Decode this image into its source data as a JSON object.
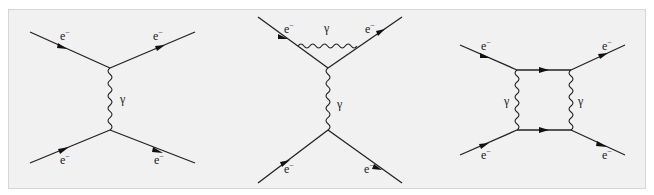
{
  "figure": {
    "background_color": "#f1f1f1",
    "line_color": "#222222",
    "diagrams": [
      {
        "name": "tree-level-electron-scattering",
        "labels": {
          "in_top": "e",
          "in_bottom": "e",
          "out_top": "e",
          "out_bottom": "e",
          "charge": "−",
          "photon": "γ"
        }
      },
      {
        "name": "vertex-correction",
        "labels": {
          "in_top": "e",
          "out_top": "e",
          "in_bottom": "e",
          "out_bottom": "e",
          "charge": "−",
          "loop_photon": "γ",
          "exchange_photon": "γ"
        }
      },
      {
        "name": "box-diagram",
        "labels": {
          "in_top": "e",
          "out_top": "e",
          "in_bottom": "e",
          "out_bottom": "e",
          "charge": "−",
          "left_photon": "γ",
          "right_photon": "γ"
        }
      }
    ]
  }
}
